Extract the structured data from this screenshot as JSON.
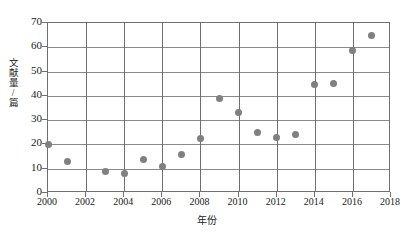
{
  "chart_data": {
    "type": "scatter",
    "title": "",
    "subtitle": "",
    "xlabel": "年份",
    "ylabel": "文献量/篇",
    "xlim": [
      2000,
      2018
    ],
    "ylim": [
      0,
      70
    ],
    "xticks": [
      "2000",
      "2002",
      "2004",
      "2006",
      "2008",
      "2010",
      "2012",
      "2014",
      "2016",
      "2018"
    ],
    "yticks": [
      "0",
      "10",
      "20",
      "30",
      "40",
      "50",
      "60",
      "70"
    ],
    "grid": true,
    "legend": null,
    "marker_color": "#808080",
    "axis_color": "#6f6f6f",
    "series": [
      {
        "name": "文献量",
        "points": [
          {
            "x": 2000,
            "y": 20
          },
          {
            "x": 2001,
            "y": 13
          },
          {
            "x": 2003,
            "y": 9
          },
          {
            "x": 2004,
            "y": 8
          },
          {
            "x": 2005,
            "y": 14
          },
          {
            "x": 2006,
            "y": 11
          },
          {
            "x": 2007,
            "y": 16
          },
          {
            "x": 2008,
            "y": 22.5
          },
          {
            "x": 2009,
            "y": 39
          },
          {
            "x": 2010,
            "y": 33
          },
          {
            "x": 2011,
            "y": 25
          },
          {
            "x": 2012,
            "y": 23
          },
          {
            "x": 2013,
            "y": 24
          },
          {
            "x": 2014,
            "y": 44.5
          },
          {
            "x": 2015,
            "y": 45
          },
          {
            "x": 2016,
            "y": 58.5
          },
          {
            "x": 2017,
            "y": 65
          }
        ]
      }
    ]
  }
}
